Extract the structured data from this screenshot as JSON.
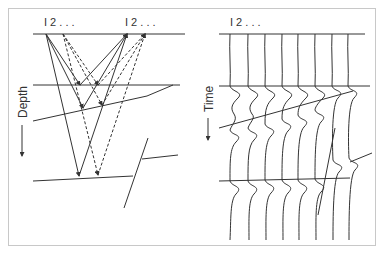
{
  "figure": {
    "left_panel": {
      "title": "Depth section (ray paths)",
      "axis_label": "Depth",
      "receiver_labels": [
        {
          "text": "I  2 . . .",
          "x": 46
        },
        {
          "text": "I  2 . . .",
          "x": 127
        }
      ],
      "sources": [
        {
          "x": 46,
          "y": 34
        },
        {
          "x": 63,
          "y": 34
        }
      ],
      "receivers": [
        {
          "x": 127,
          "y": 34
        },
        {
          "x": 145,
          "y": 34
        }
      ]
    },
    "right_panel": {
      "title": "Time section (seismic traces)",
      "axis_label": "Time",
      "trace_labels": {
        "text": "I  2 . . .",
        "x": 230
      },
      "trace_count": 8
    },
    "colors": {
      "line": "#333333",
      "frame": "#c8c8c8",
      "background": "#ffffff"
    }
  }
}
